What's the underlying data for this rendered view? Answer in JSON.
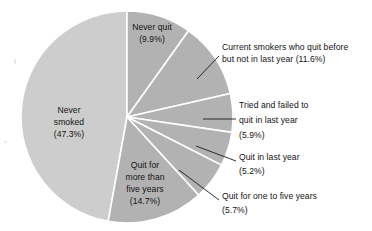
{
  "chart_data": {
    "type": "pie",
    "title": "",
    "subtitle": "",
    "xlabel": "",
    "ylabel": "",
    "legend": "none",
    "grid": false,
    "units": "percent",
    "start_angle_deg": 0,
    "direction": "clockwise",
    "categories": [
      "Never quit",
      "Current smokers who quit before but not in last year",
      "Tried and failed to quit in last year",
      "Quit in last year",
      "Quit for one to five years",
      "Quit for more than five years",
      "Never smoked"
    ],
    "values": [
      9.9,
      11.6,
      5.9,
      5.2,
      5.7,
      14.7,
      47.3
    ],
    "slices": [
      {
        "name": "never-quit",
        "label": "Never quit",
        "value_label": "(9.9%)",
        "value": 9.9,
        "color": "#b2b2b2",
        "label_placement": "inside",
        "label_x": 152,
        "label_y": 32
      },
      {
        "name": "current-smokers-quit-before",
        "label": "Current smokers who quit before",
        "label_line2": "but not in last year (11.6%)",
        "value_label": "(11.6%)",
        "value": 11.6,
        "color": "#b2b2b2",
        "label_placement": "outside",
        "label_x": 222,
        "label_y": 51
      },
      {
        "name": "tried-and-failed",
        "label": "Tried and failed to",
        "label_line2": "quit in last year",
        "value_label": "(5.9%)",
        "value": 5.9,
        "color": "#b2b2b2",
        "label_placement": "outside",
        "label_x": 239,
        "label_y": 110
      },
      {
        "name": "quit-in-last-year",
        "label": "Quit in last year",
        "value_label": "(5.2%)",
        "value": 5.2,
        "color": "#b2b2b2",
        "label_placement": "outside",
        "label_x": 239,
        "label_y": 161
      },
      {
        "name": "quit-one-to-five-years",
        "label": "Quit for one to five years",
        "value_label": "(5.7%)",
        "value": 5.7,
        "color": "#b2b2b2",
        "label_placement": "outside",
        "label_x": 222,
        "label_y": 198
      },
      {
        "name": "quit-more-than-five-years",
        "label": "Quit for",
        "label_line2": "more than",
        "label_line3": "five years",
        "value_label": "(14.7%)",
        "value": 14.7,
        "color": "#b2b2b2",
        "label_placement": "inside",
        "label_x": 145,
        "label_y": 173
      },
      {
        "name": "never-smoked",
        "label": "Never",
        "label_line2": "smoked",
        "value_label": "(47.3%)",
        "value": 47.3,
        "color": "#cdcdcd",
        "label_placement": "inside",
        "label_x": 69,
        "label_y": 117
      }
    ],
    "colors": {
      "never_smoked_fill": "#cdcdcd",
      "other_slices_fill": "#b2b2b2",
      "slice_divider": "#ffffff",
      "leader_line": "#1a1a1a",
      "label_text": "#141414",
      "background": "#ffffff"
    },
    "geometry": {
      "center_x": 127,
      "center_y": 117,
      "radius": 106
    }
  }
}
